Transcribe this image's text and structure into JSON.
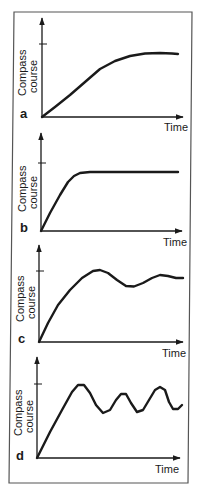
{
  "figure": {
    "frame_color": "#555555",
    "ink_color": "#1a1a1a",
    "background": "#ffffff"
  },
  "chart_data": [
    {
      "type": "line",
      "panel": "a",
      "title": "",
      "xlabel": "Time",
      "ylabel": [
        "Compass",
        "course"
      ],
      "grid": false,
      "ytick_label": "",
      "description": "Slow smooth rise approaching the target course, leveling off just below it",
      "x": [
        0,
        0.1,
        0.2,
        0.3,
        0.4,
        0.5,
        0.6,
        0.7,
        0.8,
        0.9,
        1.0
      ],
      "values": [
        0,
        0.17,
        0.34,
        0.51,
        0.66,
        0.78,
        0.86,
        0.88,
        0.88,
        0.88,
        0.87
      ],
      "target": 1.0,
      "geometry": {
        "origin": [
          42,
          117
        ],
        "x_end": 183,
        "y_top": 18,
        "tick_y": 44,
        "points": [
          [
            42,
            117
          ],
          [
            55,
            107
          ],
          [
            70,
            95
          ],
          [
            85,
            82
          ],
          [
            100,
            69
          ],
          [
            115,
            61
          ],
          [
            130,
            56
          ],
          [
            145,
            53.5
          ],
          [
            160,
            53
          ],
          [
            172,
            53.5
          ],
          [
            178,
            54
          ]
        ],
        "letter_pos": [
          20,
          118
        ],
        "xlabel_pos": [
          164,
          131
        ],
        "ylabel_pos": [
          26,
          96
        ]
      }
    },
    {
      "type": "line",
      "panel": "b",
      "title": "",
      "xlabel": "Time",
      "ylabel": [
        "Compass",
        "course"
      ],
      "grid": false,
      "description": "Fast rise then flat plateau just below the target course",
      "x": [
        0,
        0.1,
        0.2,
        0.3,
        0.4,
        0.5,
        0.6,
        0.7,
        0.8,
        0.9,
        1.0
      ],
      "values": [
        0,
        0.45,
        0.86,
        0.86,
        0.86,
        0.86,
        0.86,
        0.86,
        0.86,
        0.86,
        0.86
      ],
      "target": 1.0,
      "geometry": {
        "origin": [
          41,
          231
        ],
        "x_end": 182,
        "y_top": 133,
        "tick_y": 163,
        "points": [
          [
            41,
            231
          ],
          [
            50,
            213
          ],
          [
            60,
            195
          ],
          [
            68,
            182
          ],
          [
            74,
            176
          ],
          [
            80,
            173
          ],
          [
            90,
            172
          ],
          [
            178,
            172
          ]
        ],
        "letter_pos": [
          20,
          232
        ],
        "xlabel_pos": [
          163,
          246
        ],
        "ylabel_pos": [
          26,
          212
        ]
      }
    },
    {
      "type": "line",
      "panel": "c",
      "title": "",
      "xlabel": "Time",
      "ylabel": [
        "Compass",
        "course"
      ],
      "grid": false,
      "description": "Rise to the target course with damped oscillation settling slightly below it",
      "x": [
        0,
        0.1,
        0.2,
        0.3,
        0.4,
        0.5,
        0.6,
        0.7,
        0.8,
        0.9,
        1.0
      ],
      "values": [
        0,
        0.5,
        0.8,
        0.97,
        1.0,
        0.82,
        0.78,
        0.85,
        0.93,
        0.91,
        0.9
      ],
      "target": 1.0,
      "geometry": {
        "origin": [
          39,
          342
        ],
        "x_end": 183,
        "y_top": 245,
        "tick_y": 271,
        "points": [
          [
            39,
            342
          ],
          [
            48,
            323
          ],
          [
            58,
            305
          ],
          [
            70,
            290
          ],
          [
            82,
            278
          ],
          [
            93,
            271
          ],
          [
            100,
            270
          ],
          [
            108,
            273
          ],
          [
            117,
            280
          ],
          [
            126,
            286
          ],
          [
            134,
            286.5
          ],
          [
            143,
            283
          ],
          [
            152,
            278
          ],
          [
            160,
            275
          ],
          [
            168,
            276
          ],
          [
            176,
            278
          ],
          [
            183,
            278
          ]
        ],
        "letter_pos": [
          18,
          343
        ],
        "xlabel_pos": [
          162,
          357
        ],
        "ylabel_pos": [
          24,
          322
        ]
      }
    },
    {
      "type": "line",
      "panel": "d",
      "title": "",
      "xlabel": "Time",
      "ylabel": [
        "Compass",
        "course"
      ],
      "grid": false,
      "description": "Rapid rise overshooting to the target course followed by sustained undamped oscillation",
      "x": [
        0,
        0.1,
        0.2,
        0.3,
        0.4,
        0.5,
        0.6,
        0.7,
        0.8,
        0.9,
        1.0
      ],
      "values": [
        0,
        0.5,
        0.95,
        0.6,
        0.45,
        0.8,
        0.45,
        0.95,
        0.5,
        0.6,
        0.6
      ],
      "target": 1.0,
      "geometry": {
        "origin": [
          37,
          458
        ],
        "x_end": 180,
        "y_top": 357,
        "tick_y": 384,
        "points": [
          [
            37,
            458
          ],
          [
            50,
            432
          ],
          [
            62,
            410
          ],
          [
            72,
            392
          ],
          [
            78,
            385
          ],
          [
            84,
            385
          ],
          [
            90,
            393
          ],
          [
            96,
            405
          ],
          [
            103,
            413
          ],
          [
            110,
            410
          ],
          [
            116,
            400
          ],
          [
            121,
            394
          ],
          [
            126,
            394
          ],
          [
            131,
            403
          ],
          [
            137,
            412
          ],
          [
            143,
            410
          ],
          [
            149,
            400
          ],
          [
            155,
            390
          ],
          [
            160,
            387
          ],
          [
            165,
            390
          ],
          [
            169,
            402
          ],
          [
            173,
            409
          ],
          [
            178,
            409
          ],
          [
            182,
            405
          ]
        ],
        "letter_pos": [
          16,
          460
        ],
        "xlabel_pos": [
          155,
          473
        ],
        "ylabel_pos": [
          22,
          436
        ]
      }
    }
  ]
}
